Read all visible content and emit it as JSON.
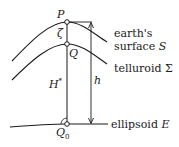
{
  "diagram": {
    "points": {
      "P": {
        "label": "P",
        "x": 67,
        "y": 22
      },
      "Q": {
        "label": "Q",
        "x": 67,
        "y": 44
      },
      "Q0": {
        "label": "Q",
        "subscript": "0",
        "x": 67,
        "y": 124
      }
    },
    "symbols": {
      "zeta": "ζ",
      "H_star": "H",
      "H_star_sup": "*",
      "h": "h"
    },
    "surfaces": [
      {
        "id": "earth_surface",
        "line1": "earth's",
        "line2": "surface ",
        "symbol": "S"
      },
      {
        "id": "telluroid",
        "line1": "telluroid ",
        "symbol": "Σ"
      },
      {
        "id": "ellipsoid",
        "line1": "ellipsoid ",
        "symbol": "E"
      }
    ],
    "colors": {
      "stroke": "#1a1a1a",
      "background": "#ffffff"
    }
  }
}
